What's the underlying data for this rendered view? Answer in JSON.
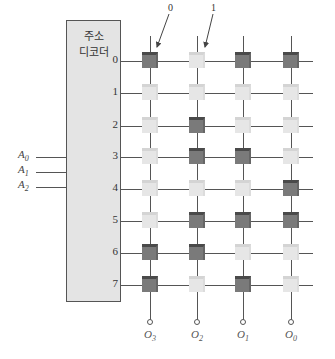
{
  "decoder": {
    "title_line1": "주소",
    "title_line2": "디코더"
  },
  "row_labels": [
    "0",
    "1",
    "2",
    "3",
    "4",
    "5",
    "6",
    "7"
  ],
  "address_inputs": [
    {
      "base": "A",
      "sub": "0"
    },
    {
      "base": "A",
      "sub": "1"
    },
    {
      "base": "A",
      "sub": "2"
    }
  ],
  "outputs": [
    {
      "base": "O",
      "sub": "3"
    },
    {
      "base": "O",
      "sub": "2"
    },
    {
      "base": "O",
      "sub": "1"
    },
    {
      "base": "O",
      "sub": "0"
    }
  ],
  "annotations": {
    "dark_cell_label": "0",
    "light_cell_label": "1"
  },
  "memory_cells": [
    [
      "dark",
      "light",
      "dark",
      "dark"
    ],
    [
      "light",
      "light",
      "light",
      "light"
    ],
    [
      "light",
      "dark",
      "light",
      "light"
    ],
    [
      "light",
      "dark",
      "dark",
      "light"
    ],
    [
      "light",
      "light",
      "light",
      "dark"
    ],
    [
      "light",
      "dark",
      "dark",
      "dark"
    ],
    [
      "dark",
      "dark",
      "light",
      "light"
    ],
    [
      "dark",
      "light",
      "dark",
      "light"
    ]
  ],
  "colors": {
    "dark_cell": "#7a7a7a",
    "light_cell": "#e6e6e6",
    "decoder_fill": "#e4e4e4"
  }
}
